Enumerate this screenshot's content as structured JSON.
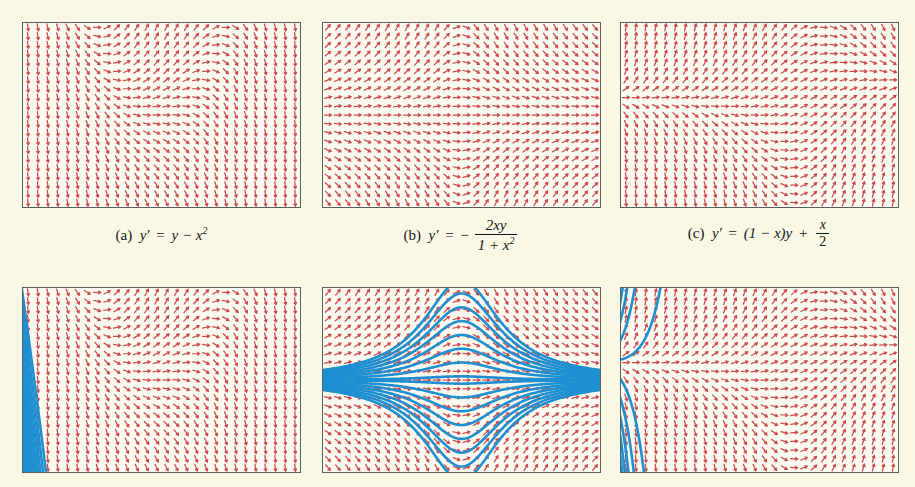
{
  "figure": {
    "background_color": "#f9f8e4",
    "panel_background": "#fbfaf0",
    "border_color": "#57605c",
    "arrow_color": "#cc4a4a",
    "curve_color": "#1e8fd0",
    "rows": 2,
    "columns": 3,
    "panel_width": 279,
    "panel_height": 186
  },
  "captions": [
    {
      "id": "caption-a",
      "label": "(a)",
      "lhs": "y′",
      "equals": "=",
      "rhs_plain": "y − x",
      "exponent": "2",
      "full_text": "(a) y′ = y − x²",
      "equation": "y' = y - x^2"
    },
    {
      "id": "caption-b",
      "label": "(b)",
      "lhs": "y′",
      "equals": "=",
      "sign": "−",
      "numerator": "2xy",
      "denominator_left": "1 + x",
      "denominator_exponent": "2",
      "full_text": "(b) y′ = − 2xy / (1 + x²)",
      "equation": "y' = -2xy/(1+x^2)"
    },
    {
      "id": "caption-c",
      "label": "(c)",
      "lhs": "y′",
      "equals": "=",
      "rhs_prefix": "(1 − x)y",
      "plus": "+",
      "numerator": "x",
      "denominator": "2",
      "full_text": "(c) y′ = (1 − x)y + x/2",
      "equation": "y' = (1-x)y + x/2"
    }
  ],
  "chart_data": {
    "type": "scatter",
    "subplots": [
      {
        "name": "panel-a-direction-field",
        "row": 1,
        "column": 1,
        "kind": "direction-field",
        "equation": "y' = y - x^2",
        "xlim": [
          -3,
          3
        ],
        "ylim": [
          -2,
          2
        ],
        "grid": false,
        "arrow_rows": 21,
        "arrow_cols": 28,
        "has_curves": false
      },
      {
        "name": "panel-b-direction-field",
        "row": 1,
        "column": 2,
        "kind": "direction-field",
        "equation": "y' = -2*x*y/(1+x^2)",
        "xlim": [
          -3,
          3
        ],
        "ylim": [
          -2,
          2
        ],
        "grid": false,
        "arrow_rows": 21,
        "arrow_cols": 28,
        "has_curves": false
      },
      {
        "name": "panel-c-direction-field",
        "row": 1,
        "column": 3,
        "kind": "direction-field",
        "equation": "y' = (1-x)*y + x/2",
        "xlim": [
          -3,
          3
        ],
        "ylim": [
          -2,
          2
        ],
        "grid": false,
        "arrow_rows": 21,
        "arrow_cols": 28,
        "has_curves": false
      },
      {
        "name": "panel-d-solution-curves",
        "row": 2,
        "column": 1,
        "kind": "direction-field-with-solutions",
        "equation": "y' = y - x^2",
        "xlim": [
          -3,
          3
        ],
        "ylim": [
          -2,
          2
        ],
        "grid": false,
        "arrow_rows": 21,
        "arrow_cols": 28,
        "has_curves": true,
        "curve_count": 12
      },
      {
        "name": "panel-e-solution-curves",
        "row": 2,
        "column": 2,
        "kind": "direction-field-with-solutions",
        "equation": "y' = -2*x*y/(1+x^2)",
        "xlim": [
          -3,
          3
        ],
        "ylim": [
          -2,
          2
        ],
        "grid": false,
        "arrow_rows": 21,
        "arrow_cols": 28,
        "has_curves": true,
        "curve_count": 15
      },
      {
        "name": "panel-f-solution-curves",
        "row": 2,
        "column": 3,
        "kind": "direction-field-with-solutions",
        "equation": "y' = (1-x)*y + x/2",
        "xlim": [
          -3,
          3
        ],
        "ylim": [
          -2,
          2
        ],
        "grid": false,
        "arrow_rows": 21,
        "arrow_cols": 28,
        "has_curves": true,
        "curve_count": 9
      }
    ]
  }
}
